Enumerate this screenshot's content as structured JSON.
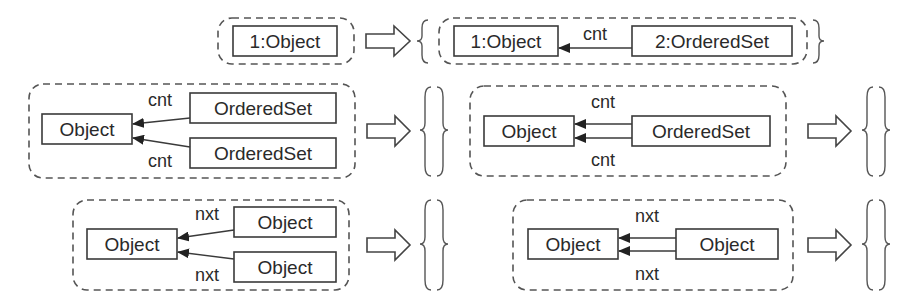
{
  "figure": {
    "rows": [
      {
        "id": "row1",
        "lhs": {
          "nodes": [
            "1:Object"
          ]
        },
        "rhs": {
          "nodes": [
            "1:Object",
            "2:OrderedSet"
          ],
          "edges": [
            {
              "from": "2:OrderedSet",
              "to": "1:Object",
              "label": "cnt"
            }
          ]
        }
      },
      {
        "id": "row2",
        "rules": [
          {
            "lhs": {
              "nodes": [
                "Object",
                "OrderedSet",
                "OrderedSet"
              ],
              "edges": [
                {
                  "from": "OrderedSet",
                  "to": "Object",
                  "label": "cnt"
                },
                {
                  "from": "OrderedSet",
                  "to": "Object",
                  "label": "cnt"
                }
              ]
            },
            "rhs": "{ }"
          },
          {
            "lhs": {
              "nodes": [
                "Object",
                "OrderedSet"
              ],
              "edges": [
                {
                  "from": "OrderedSet",
                  "to": "Object",
                  "label": "cnt"
                },
                {
                  "from": "OrderedSet",
                  "to": "Object",
                  "label": "cnt"
                }
              ]
            },
            "rhs": "{ }"
          }
        ]
      },
      {
        "id": "row3",
        "rules": [
          {
            "lhs": {
              "nodes": [
                "Object",
                "Object",
                "Object"
              ],
              "edges": [
                {
                  "from": "Object",
                  "to": "Object",
                  "label": "nxt"
                },
                {
                  "from": "Object",
                  "to": "Object",
                  "label": "nxt"
                }
              ]
            },
            "rhs": "{ }"
          },
          {
            "lhs": {
              "nodes": [
                "Object",
                "Object"
              ],
              "edges": [
                {
                  "from": "Object",
                  "to": "Object",
                  "label": "nxt"
                },
                {
                  "from": "Object",
                  "to": "Object",
                  "label": "nxt"
                }
              ]
            },
            "rhs": "{ }"
          }
        ]
      }
    ]
  },
  "labels": {
    "r1_lhs_obj": "1:Object",
    "r1_rhs_obj": "1:Object",
    "r1_rhs_set": "2:OrderedSet",
    "r1_rhs_edge": "cnt",
    "r2a_obj": "Object",
    "r2a_set1": "OrderedSet",
    "r2a_set2": "OrderedSet",
    "r2a_edge1": "cnt",
    "r2a_edge2": "cnt",
    "r2b_obj": "Object",
    "r2b_set": "OrderedSet",
    "r2b_edge1": "cnt",
    "r2b_edge2": "cnt",
    "r3a_obj": "Object",
    "r3a_obj1": "Object",
    "r3a_obj2": "Object",
    "r3a_edge1": "nxt",
    "r3a_edge2": "nxt",
    "r3b_obj": "Object",
    "r3b_obj2": "Object",
    "r3b_edge1": "nxt",
    "r3b_edge2": "nxt"
  },
  "colors": {
    "stroke": "#3a3a3a",
    "text": "#2a2a2a",
    "background": "#ffffff"
  }
}
